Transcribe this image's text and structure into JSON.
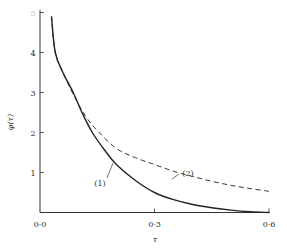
{
  "chart_data": {
    "type": "line",
    "title": "",
    "xlabel": "τ",
    "ylabel": "φ(τ)",
    "xlim": [
      0.0,
      0.6
    ],
    "ylim": [
      0,
      5
    ],
    "grid": false,
    "legend": "inline labels (1) and (2)",
    "x_ticks": [
      "0·0",
      "0·3",
      "0·6"
    ],
    "y_ticks": [
      "1",
      "2",
      "3",
      "4",
      "5"
    ],
    "series": [
      {
        "name": "(1)",
        "style": "solid",
        "points": [
          [
            0.03,
            4.9
          ],
          [
            0.04,
            4.0
          ],
          [
            0.06,
            3.5
          ],
          [
            0.087,
            3.0
          ],
          [
            0.11,
            2.5
          ],
          [
            0.137,
            2.0
          ],
          [
            0.17,
            1.55
          ],
          [
            0.2,
            1.2
          ],
          [
            0.25,
            0.8
          ],
          [
            0.3,
            0.5
          ],
          [
            0.35,
            0.32
          ],
          [
            0.4,
            0.2
          ],
          [
            0.45,
            0.12
          ],
          [
            0.5,
            0.06
          ],
          [
            0.55,
            0.02
          ],
          [
            0.6,
            0.0
          ]
        ]
      },
      {
        "name": "(2)",
        "style": "dashed",
        "points": [
          [
            0.03,
            4.9
          ],
          [
            0.04,
            4.0
          ],
          [
            0.06,
            3.5
          ],
          [
            0.09,
            2.9
          ],
          [
            0.12,
            2.4
          ],
          [
            0.15,
            2.05
          ],
          [
            0.2,
            1.6
          ],
          [
            0.25,
            1.37
          ],
          [
            0.3,
            1.2
          ],
          [
            0.35,
            1.03
          ],
          [
            0.4,
            0.9
          ],
          [
            0.45,
            0.78
          ],
          [
            0.5,
            0.68
          ],
          [
            0.55,
            0.6
          ],
          [
            0.6,
            0.53
          ]
        ]
      }
    ]
  },
  "labels": {
    "x_axis": "τ",
    "y_axis": "φ(τ)",
    "series1": "(1)",
    "series2": "(2)"
  }
}
